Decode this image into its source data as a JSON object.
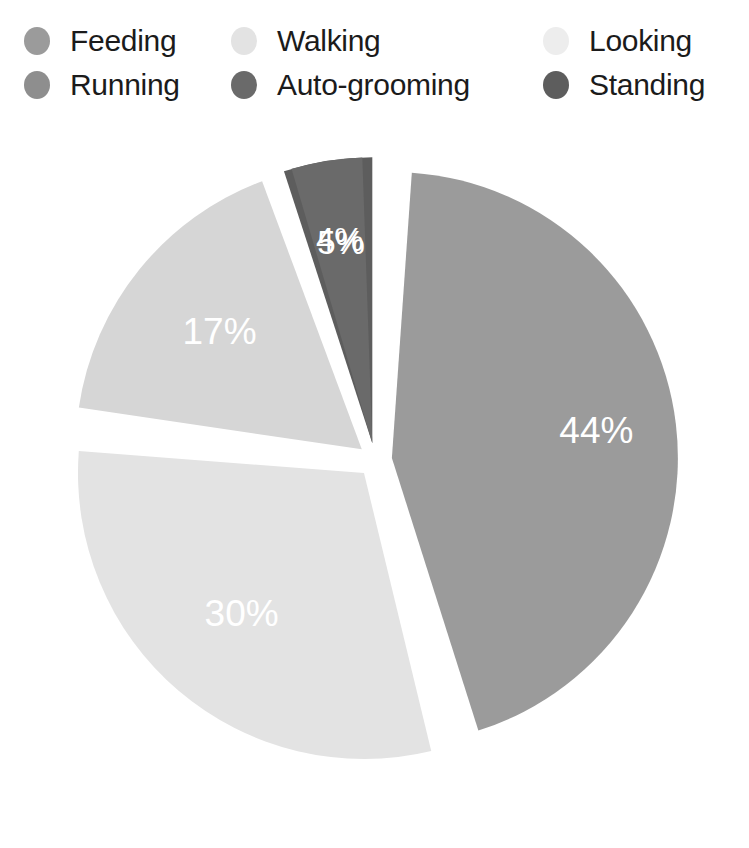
{
  "legend": {
    "items": [
      {
        "label": "Feeding",
        "color": "#9b9b9b",
        "col": 1,
        "row": 1
      },
      {
        "label": "Running",
        "color": "#8e8e8e",
        "col": 1,
        "row": 2
      },
      {
        "label": "Walking",
        "color": "#e3e3e3",
        "col": 2,
        "row": 1
      },
      {
        "label": "Auto-grooming",
        "color": "#6a6a6a",
        "col": 2,
        "row": 2
      },
      {
        "label": "Looking",
        "color": "#ededed",
        "col": 3,
        "row": 1
      },
      {
        "label": "Standing",
        "color": "#5d5d5d",
        "col": 3,
        "row": 2
      }
    ]
  },
  "chart_data": {
    "type": "pie",
    "title": "",
    "exploded": true,
    "legend_position": "top",
    "categories": [
      "Feeding",
      "Walking",
      "Looking",
      "Standing",
      "Auto-grooming",
      "Running"
    ],
    "values": [
      44,
      30,
      17,
      5,
      4,
      0
    ],
    "labels": [
      "44%",
      "30%",
      "17%",
      "5%",
      "4%",
      ""
    ],
    "colors": [
      "#9b9b9b",
      "#e3e3e3",
      "#d6d6d6",
      "#5d5d5d",
      "#6a6a6a",
      "#8e8e8e"
    ],
    "slices": [
      {
        "name": "Standing",
        "value": 5,
        "label": "5%",
        "color": "#5d5d5d",
        "start_deg": -18.0,
        "end_deg": 0.0,
        "label_r": 0.7
      },
      {
        "name": "Feeding",
        "value": 44,
        "label": "44%",
        "color": "#9b9b9b",
        "start_deg": 4.0,
        "end_deg": 162.4,
        "label_r": 0.72
      },
      {
        "name": "Walking",
        "value": 30,
        "label": "30%",
        "color": "#e3e3e3",
        "start_deg": 166.4,
        "end_deg": 274.4,
        "label_r": 0.66
      },
      {
        "name": "Looking",
        "value": 17,
        "label": "17%",
        "color": "#d6d6d6",
        "start_deg": 278.4,
        "end_deg": 339.6,
        "label_r": 0.64
      },
      {
        "name": "Auto-grooming",
        "value": 4,
        "label": "4%",
        "color": "#6a6a6a",
        "start_deg": 343.6,
        "end_deg": 358.0,
        "label_r": 0.71
      }
    ],
    "units": "percent",
    "total": 100
  }
}
